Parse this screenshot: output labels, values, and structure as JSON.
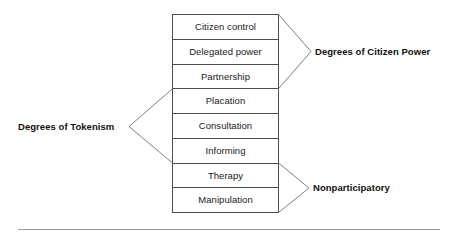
{
  "diagram": {
    "name": "ladder-of-citizen-participation",
    "ladder": {
      "rungs": [
        {
          "id": "citizen-control",
          "label": "Citizen control",
          "level": 8
        },
        {
          "id": "delegated-power",
          "label": "Delegated power",
          "level": 7
        },
        {
          "id": "partnership",
          "label": "Partnership",
          "level": 6
        },
        {
          "id": "placation",
          "label": "Placation",
          "level": 5
        },
        {
          "id": "consultation",
          "label": "Consultation",
          "level": 4
        },
        {
          "id": "informing",
          "label": "Informing",
          "level": 3
        },
        {
          "id": "therapy",
          "label": "Therapy",
          "level": 2
        },
        {
          "id": "manipulation",
          "label": "Manipulation",
          "level": 1
        }
      ]
    },
    "groups": [
      {
        "id": "degrees-of-citizen-power",
        "label": "Degrees of Citizen Power",
        "side": "right",
        "covers": [
          "Citizen control",
          "Delegated power",
          "Partnership"
        ]
      },
      {
        "id": "degrees-of-tokenism",
        "label": "Degrees of Tokenism",
        "side": "left",
        "covers": [
          "Placation",
          "Consultation",
          "Informing"
        ]
      },
      {
        "id": "nonparticipatory",
        "label": "Nonparticipatory",
        "side": "right",
        "covers": [
          "Therapy",
          "Manipulation"
        ]
      }
    ],
    "colors": {
      "background": "#ffffff",
      "box_stroke": "#4d4d4d",
      "bracket_stroke": "#808080",
      "rule_stroke": "#9a9a9a",
      "rung_text": "#1a1a1a",
      "caption_text": "#111111"
    }
  }
}
